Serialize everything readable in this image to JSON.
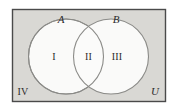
{
  "figure": {
    "kind": "venn-diagram"
  },
  "colors": {
    "page_background": "#ffffff",
    "universe_fill": "#d9d8d4",
    "universe_border": "#4a4a4a",
    "circle_fill": "#fbfbfa",
    "circle_stroke": "#8b8b88",
    "label_color": "#2b2b2b"
  },
  "labels": {
    "set_a": "A",
    "set_b": "B",
    "region_one": "I",
    "region_two": "II",
    "region_three": "III",
    "region_four": "IV",
    "universe": "U"
  },
  "geometry": {
    "canvas": {
      "width": 179,
      "height": 112
    },
    "universe_rect": {
      "x": 12,
      "y": 9,
      "width": 154,
      "height": 93
    },
    "circle_a": {
      "cx": 66,
      "cy": 56.5,
      "r": 37.5
    },
    "circle_b": {
      "cx": 111,
      "cy": 56.5,
      "r": 37.5
    },
    "label_positions": {
      "set_a": {
        "x": 61,
        "y": 23
      },
      "set_b": {
        "x": 116,
        "y": 23
      },
      "region_one": {
        "x": 54,
        "y": 60
      },
      "region_two": {
        "x": 88.5,
        "y": 60
      },
      "region_three": {
        "x": 117,
        "y": 60
      },
      "region_four": {
        "x": 23,
        "y": 95
      },
      "universe": {
        "x": 155,
        "y": 95
      }
    }
  }
}
